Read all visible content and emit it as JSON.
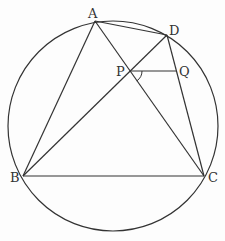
{
  "diagram": {
    "type": "geometry",
    "stroke_color": "#333333",
    "circle": {
      "cx": 113,
      "cy": 126,
      "r": 105
    },
    "points": {
      "A": {
        "label": "A",
        "x": 95,
        "y": 21,
        "lx": 88,
        "ly": 18
      },
      "D": {
        "label": "D",
        "x": 167,
        "y": 35,
        "lx": 169,
        "ly": 35
      },
      "P": {
        "label": "P",
        "x": 130,
        "y": 71,
        "lx": 116,
        "ly": 76
      },
      "Q": {
        "label": "Q",
        "x": 176,
        "y": 71,
        "lx": 179,
        "ly": 76
      },
      "B": {
        "label": "B",
        "x": 23,
        "y": 176,
        "lx": 10,
        "ly": 182
      },
      "C": {
        "label": "C",
        "x": 204,
        "y": 176,
        "lx": 208,
        "ly": 182
      }
    },
    "segments": [
      [
        "A",
        "B"
      ],
      [
        "A",
        "C"
      ],
      [
        "A",
        "D"
      ],
      [
        "B",
        "D"
      ],
      [
        "D",
        "C"
      ],
      [
        "B",
        "C"
      ],
      [
        "P",
        "Q"
      ]
    ],
    "angle_mark": {
      "at": "P",
      "between": [
        "Q",
        "C"
      ]
    }
  }
}
